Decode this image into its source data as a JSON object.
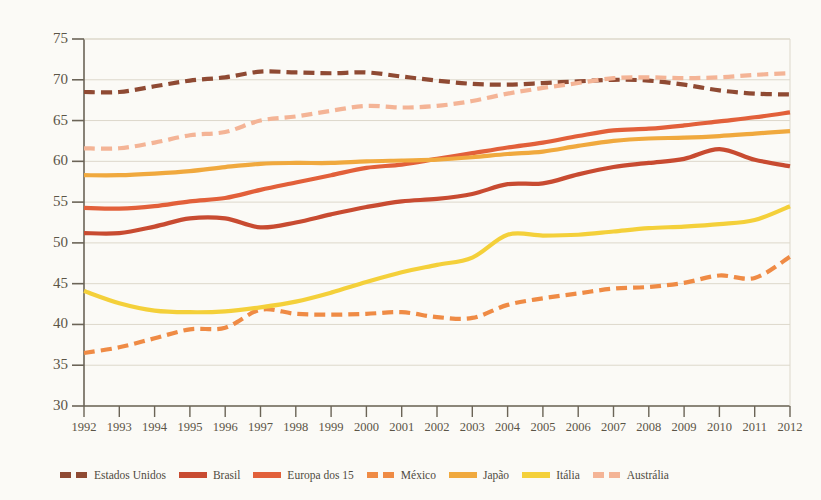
{
  "chart_data": {
    "type": "line",
    "title": "",
    "subtitle": "",
    "xlabel": "",
    "ylabel": "",
    "grid": true,
    "legend_position": "bottom",
    "xlim": [
      1992,
      2012
    ],
    "ylim": [
      30,
      75
    ],
    "y_ticks": [
      75,
      70,
      65,
      60,
      55,
      50,
      45,
      40,
      35,
      30
    ],
    "x_ticks": [
      1992,
      1993,
      1994,
      1995,
      1996,
      1997,
      1998,
      1999,
      2000,
      2001,
      2002,
      2003,
      2004,
      2005,
      2006,
      2007,
      2008,
      2009,
      2010,
      2011,
      2012
    ],
    "categories": [
      1992,
      1993,
      1994,
      1995,
      1996,
      1997,
      1998,
      1999,
      2000,
      2001,
      2002,
      2003,
      2004,
      2005,
      2006,
      2007,
      2008,
      2009,
      2010,
      2011,
      2012
    ],
    "series": [
      {
        "name": "Estados Unidos",
        "color": "#8f4a33",
        "style": "dashed",
        "values": [
          68.5,
          68.5,
          69.2,
          69.9,
          70.3,
          71.0,
          70.9,
          70.8,
          70.9,
          70.4,
          69.9,
          69.5,
          69.4,
          69.6,
          69.8,
          70.0,
          69.9,
          69.4,
          68.7,
          68.3,
          68.2
        ]
      },
      {
        "name": "Brasil",
        "color": "#c84b31",
        "style": "solid",
        "values": [
          51.2,
          51.2,
          52.0,
          53.0,
          53.0,
          51.9,
          52.5,
          53.5,
          54.4,
          55.1,
          55.4,
          56.0,
          57.2,
          57.3,
          58.4,
          59.3,
          59.8,
          60.3,
          61.5,
          60.2,
          59.4
        ]
      },
      {
        "name": "Europa dos 15",
        "color": "#e2603a",
        "style": "solid",
        "values": [
          54.3,
          54.2,
          54.5,
          55.1,
          55.5,
          56.5,
          57.4,
          58.3,
          59.2,
          59.6,
          60.3,
          61.0,
          61.7,
          62.3,
          63.1,
          63.8,
          64.0,
          64.4,
          64.9,
          65.4,
          66.0
        ]
      },
      {
        "name": "México",
        "color": "#ef8b45",
        "style": "dashed",
        "values": [
          36.5,
          37.2,
          38.3,
          39.4,
          39.6,
          41.8,
          41.3,
          41.2,
          41.3,
          41.5,
          40.9,
          40.8,
          42.4,
          43.2,
          43.8,
          44.4,
          44.6,
          45.1,
          46.0,
          45.7,
          48.3
        ]
      },
      {
        "name": "Japão",
        "color": "#f0a93e",
        "style": "solid",
        "values": [
          58.3,
          58.3,
          58.5,
          58.8,
          59.3,
          59.7,
          59.8,
          59.8,
          60.0,
          60.1,
          60.2,
          60.5,
          60.9,
          61.2,
          61.9,
          62.5,
          62.8,
          62.9,
          63.1,
          63.4,
          63.7
        ]
      },
      {
        "name": "Itália",
        "color": "#f4d03a",
        "style": "solid",
        "values": [
          44.1,
          42.6,
          41.7,
          41.5,
          41.6,
          42.1,
          42.8,
          43.9,
          45.2,
          46.4,
          47.3,
          48.2,
          51.0,
          50.9,
          51.0,
          51.4,
          51.8,
          52.0,
          52.3,
          52.8,
          54.5
        ]
      },
      {
        "name": "Austrália",
        "color": "#f4b496",
        "style": "dashed",
        "values": [
          61.6,
          61.6,
          62.3,
          63.2,
          63.6,
          65.0,
          65.5,
          66.2,
          66.8,
          66.6,
          66.8,
          67.4,
          68.3,
          69.0,
          69.6,
          70.2,
          70.3,
          70.2,
          70.3,
          70.6,
          70.8
        ]
      }
    ]
  },
  "axis": {
    "y_labels": [
      "75",
      "70",
      "65",
      "60",
      "55",
      "50",
      "45",
      "40",
      "35",
      "30"
    ],
    "x_labels": [
      "1992",
      "1993",
      "1994",
      "1995",
      "1996",
      "1997",
      "1998",
      "1999",
      "2000",
      "2001",
      "2002",
      "2003",
      "2004",
      "2005",
      "2006",
      "2007",
      "2008",
      "2009",
      "2010",
      "2011",
      "2012"
    ]
  },
  "legend": {
    "items": [
      {
        "label": "Estados Unidos",
        "color": "#8f4a33",
        "style": "dashed"
      },
      {
        "label": "Brasil",
        "color": "#c84b31",
        "style": "solid"
      },
      {
        "label": "Europa dos 15",
        "color": "#e2603a",
        "style": "solid"
      },
      {
        "label": "México",
        "color": "#ef8b45",
        "style": "dashed"
      },
      {
        "label": "Japão",
        "color": "#f0a93e",
        "style": "solid"
      },
      {
        "label": "Itália",
        "color": "#f4d03a",
        "style": "solid"
      },
      {
        "label": "Austrália",
        "color": "#f4b496",
        "style": "dashed"
      }
    ]
  },
  "colors": {
    "background": "#fbfaf6",
    "axis": "#6b6457",
    "gridline": "#ddd8cb",
    "tick_text": "#5b5547"
  }
}
